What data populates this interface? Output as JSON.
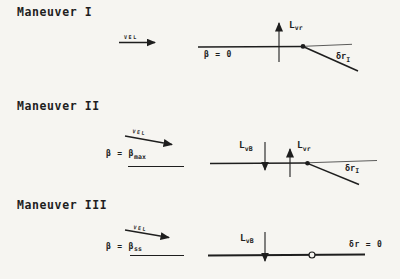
{
  "figure": {
    "bg_color": "#f6f5f1",
    "ink_color": "#1e1e1e"
  },
  "maneuvers": [
    {
      "title": "Maneuver I",
      "vel_label": "vel",
      "beta_label": "β = 0",
      "lift_vr": {
        "main": "L",
        "sub": "vr"
      },
      "rudder": {
        "main": "δr",
        "sub": "I"
      }
    },
    {
      "title": "Maneuver II",
      "vel_label": "vel",
      "beta_label": {
        "main": "β = β",
        "sub": "max"
      },
      "lift_vb": {
        "main": "L",
        "sub": "vB"
      },
      "lift_vr": {
        "main": "L",
        "sub": "vr"
      },
      "rudder": {
        "main": "δr",
        "sub": "I"
      }
    },
    {
      "title": "Maneuver III",
      "vel_label": "vel",
      "beta_label": {
        "main": "β = β",
        "sub": "ss"
      },
      "lift_vb": {
        "main": "L",
        "sub": "vB"
      },
      "rudder_label": "δr = 0"
    }
  ]
}
